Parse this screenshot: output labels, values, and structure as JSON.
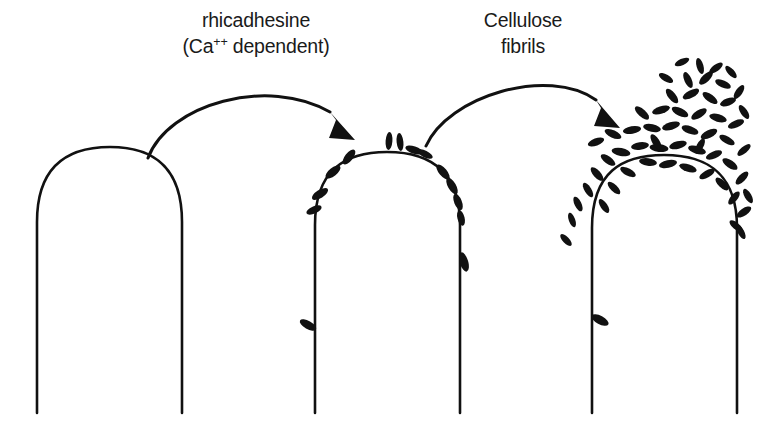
{
  "figure": {
    "background_color": "#ffffff",
    "ink_color": "#111111",
    "width": 777,
    "height": 428
  },
  "labels": [
    {
      "name": "rhicadhesine-label",
      "line1": "rhicadhesine",
      "line2_prefix": "(Ca",
      "line2_sup": "++",
      "line2_suffix": " dependent)",
      "x": 256,
      "y1": 27,
      "y2": 53
    },
    {
      "name": "cellulose-fibrils-label",
      "line1": "Cellulose",
      "line2": "fibrils",
      "x": 523,
      "y1": 27,
      "y2": 53
    }
  ],
  "arrows": [
    {
      "name": "arrow-stage-1-to-2",
      "path": "M 148 158 C 168 104 268 76 330 112",
      "head": "M 330 112 L 355 140 L 329 138 L 336 120 Z"
    },
    {
      "name": "arrow-stage-2-to-3",
      "path": "M 426 146 C 448 96 548 66 596 100",
      "head": "M 596 100 L 620 128 L 594 126 L 601 108 Z"
    }
  ],
  "cells": [
    {
      "name": "root-tip-stage-1-bare",
      "outline": "M 37 413 L 37 222 C 37 166 68 147 110 147 C 152 147 182 166 182 222 L 182 413",
      "left_stem_x": 37,
      "right_stem_x": 182,
      "apex_y": 147,
      "base_y": 413,
      "bacteria": []
    },
    {
      "name": "root-tip-stage-2-sparse-attachment",
      "outline": "M 315 413 L 315 225 C 315 170 345 152 387 152 C 429 152 460 170 460 225 L 460 413",
      "left_stem_x": 315,
      "right_stem_x": 460,
      "apex_y": 152,
      "base_y": 413,
      "bacteria": [
        {
          "cx": 389,
          "cy": 141,
          "rx": 3.4,
          "ry": 9.0,
          "rot": 4
        },
        {
          "cx": 400,
          "cy": 142,
          "rx": 3.4,
          "ry": 9.0,
          "rot": -6
        },
        {
          "cx": 414,
          "cy": 150,
          "rx": 9.0,
          "ry": 3.6,
          "rot": 18
        },
        {
          "cx": 425,
          "cy": 154,
          "rx": 8.4,
          "ry": 3.4,
          "rot": 26
        },
        {
          "cx": 349,
          "cy": 157,
          "rx": 4.0,
          "ry": 9.0,
          "rot": 38
        },
        {
          "cx": 333,
          "cy": 172,
          "rx": 4.0,
          "ry": 9.0,
          "rot": 52
        },
        {
          "cx": 443,
          "cy": 172,
          "rx": 4.0,
          "ry": 9.2,
          "rot": -40
        },
        {
          "cx": 452,
          "cy": 186,
          "rx": 4.0,
          "ry": 9.2,
          "rot": -30
        },
        {
          "cx": 458,
          "cy": 202,
          "rx": 3.8,
          "ry": 8.6,
          "rot": -22
        },
        {
          "cx": 461,
          "cy": 218,
          "rx": 3.6,
          "ry": 8.0,
          "rot": -14
        },
        {
          "cx": 320,
          "cy": 194,
          "rx": 4.0,
          "ry": 9.2,
          "rot": 58
        },
        {
          "cx": 314,
          "cy": 210,
          "rx": 3.6,
          "ry": 8.2,
          "rot": 66
        },
        {
          "cx": 464,
          "cy": 262,
          "rx": 4.2,
          "ry": 10.0,
          "rot": -16
        },
        {
          "cx": 308,
          "cy": 325,
          "rx": 9.2,
          "ry": 4.0,
          "rot": 30
        }
      ]
    },
    {
      "name": "root-tip-stage-3-dense-biofilm",
      "outline": "M 592 413 L 592 228 C 592 172 622 155 664 155 C 706 155 737 172 737 228 L 737 413",
      "left_stem_x": 592,
      "right_stem_x": 737,
      "apex_y": 155,
      "base_y": 413,
      "bacteria": [
        {
          "cx": 621,
          "cy": 152,
          "rx": 9.5,
          "ry": 4.0,
          "rot": 10
        },
        {
          "cx": 640,
          "cy": 146,
          "rx": 9.0,
          "ry": 3.8,
          "rot": -8
        },
        {
          "cx": 659,
          "cy": 148,
          "rx": 9.5,
          "ry": 4.0,
          "rot": 6
        },
        {
          "cx": 678,
          "cy": 145,
          "rx": 9.0,
          "ry": 3.8,
          "rot": -14
        },
        {
          "cx": 697,
          "cy": 150,
          "rx": 9.2,
          "ry": 3.8,
          "rot": 16
        },
        {
          "cx": 714,
          "cy": 155,
          "rx": 8.6,
          "ry": 3.6,
          "rot": -22
        },
        {
          "cx": 730,
          "cy": 164,
          "rx": 8.8,
          "ry": 3.8,
          "rot": 34
        },
        {
          "cx": 742,
          "cy": 178,
          "rx": 8.4,
          "ry": 3.6,
          "rot": -46
        },
        {
          "cx": 748,
          "cy": 196,
          "rx": 8.0,
          "ry": 3.4,
          "rot": 60
        },
        {
          "cx": 744,
          "cy": 212,
          "rx": 8.4,
          "ry": 3.6,
          "rot": -34
        },
        {
          "cx": 736,
          "cy": 226,
          "rx": 8.0,
          "ry": 3.4,
          "rot": 40
        },
        {
          "cx": 608,
          "cy": 160,
          "rx": 8.6,
          "ry": 3.6,
          "rot": 36
        },
        {
          "cx": 597,
          "cy": 174,
          "rx": 8.6,
          "ry": 3.6,
          "rot": 48
        },
        {
          "cx": 588,
          "cy": 190,
          "rx": 8.2,
          "ry": 3.4,
          "rot": 58
        },
        {
          "cx": 578,
          "cy": 204,
          "rx": 8.0,
          "ry": 3.4,
          "rot": 64
        },
        {
          "cx": 572,
          "cy": 220,
          "rx": 7.6,
          "ry": 3.2,
          "rot": 70
        },
        {
          "cx": 596,
          "cy": 142,
          "rx": 8.6,
          "ry": 3.6,
          "rot": -20
        },
        {
          "cx": 613,
          "cy": 134,
          "rx": 9.0,
          "ry": 3.8,
          "rot": 24
        },
        {
          "cx": 632,
          "cy": 130,
          "rx": 9.2,
          "ry": 3.8,
          "rot": -10
        },
        {
          "cx": 652,
          "cy": 128,
          "rx": 9.0,
          "ry": 3.8,
          "rot": 12
        },
        {
          "cx": 671,
          "cy": 126,
          "rx": 9.2,
          "ry": 3.8,
          "rot": -16
        },
        {
          "cx": 690,
          "cy": 130,
          "rx": 8.8,
          "ry": 3.8,
          "rot": 20
        },
        {
          "cx": 709,
          "cy": 134,
          "rx": 9.0,
          "ry": 3.8,
          "rot": -26
        },
        {
          "cx": 727,
          "cy": 140,
          "rx": 8.6,
          "ry": 3.6,
          "rot": 30
        },
        {
          "cx": 744,
          "cy": 150,
          "rx": 8.2,
          "ry": 3.4,
          "rot": -40
        },
        {
          "cx": 642,
          "cy": 113,
          "rx": 9.0,
          "ry": 3.8,
          "rot": 42
        },
        {
          "cx": 661,
          "cy": 110,
          "rx": 9.2,
          "ry": 3.8,
          "rot": -18
        },
        {
          "cx": 680,
          "cy": 112,
          "rx": 9.0,
          "ry": 3.8,
          "rot": 26
        },
        {
          "cx": 699,
          "cy": 114,
          "rx": 8.8,
          "ry": 3.8,
          "rot": -32
        },
        {
          "cx": 718,
          "cy": 118,
          "rx": 9.0,
          "ry": 3.8,
          "rot": 16
        },
        {
          "cx": 736,
          "cy": 124,
          "rx": 8.6,
          "ry": 3.6,
          "rot": -22
        },
        {
          "cx": 672,
          "cy": 96,
          "rx": 8.8,
          "ry": 3.8,
          "rot": 52
        },
        {
          "cx": 691,
          "cy": 94,
          "rx": 9.0,
          "ry": 3.8,
          "rot": -28
        },
        {
          "cx": 710,
          "cy": 98,
          "rx": 8.8,
          "ry": 3.8,
          "rot": 36
        },
        {
          "cx": 728,
          "cy": 102,
          "rx": 8.4,
          "ry": 3.6,
          "rot": -20
        },
        {
          "cx": 744,
          "cy": 112,
          "rx": 8.0,
          "ry": 3.4,
          "rot": 56
        },
        {
          "cx": 688,
          "cy": 80,
          "rx": 8.6,
          "ry": 3.6,
          "rot": 66
        },
        {
          "cx": 706,
          "cy": 78,
          "rx": 8.8,
          "ry": 3.8,
          "rot": -44
        },
        {
          "cx": 723,
          "cy": 84,
          "rx": 8.4,
          "ry": 3.6,
          "rot": 24
        },
        {
          "cx": 739,
          "cy": 92,
          "rx": 8.0,
          "ry": 3.4,
          "rot": -56
        },
        {
          "cx": 700,
          "cy": 66,
          "rx": 8.2,
          "ry": 3.4,
          "rot": 74
        },
        {
          "cx": 716,
          "cy": 68,
          "rx": 8.0,
          "ry": 3.4,
          "rot": -36
        },
        {
          "cx": 731,
          "cy": 72,
          "rx": 7.8,
          "ry": 3.2,
          "rot": 48
        },
        {
          "cx": 648,
          "cy": 162,
          "rx": 9.0,
          "ry": 3.8,
          "rot": 8
        },
        {
          "cx": 668,
          "cy": 164,
          "rx": 9.2,
          "ry": 3.8,
          "rot": -12
        },
        {
          "cx": 688,
          "cy": 168,
          "rx": 9.0,
          "ry": 3.8,
          "rot": 18
        },
        {
          "cx": 707,
          "cy": 174,
          "rx": 8.6,
          "ry": 3.6,
          "rot": -30
        },
        {
          "cx": 722,
          "cy": 184,
          "rx": 8.4,
          "ry": 3.6,
          "rot": 44
        },
        {
          "cx": 734,
          "cy": 198,
          "rx": 8.0,
          "ry": 3.4,
          "rot": -50
        },
        {
          "cx": 741,
          "cy": 232,
          "rx": 7.8,
          "ry": 3.2,
          "rot": 62
        },
        {
          "cx": 628,
          "cy": 172,
          "rx": 8.6,
          "ry": 3.6,
          "rot": 28
        },
        {
          "cx": 614,
          "cy": 188,
          "rx": 8.2,
          "ry": 3.4,
          "rot": 44
        },
        {
          "cx": 604,
          "cy": 206,
          "rx": 8.0,
          "ry": 3.4,
          "rot": 56
        },
        {
          "cx": 566,
          "cy": 240,
          "rx": 7.6,
          "ry": 3.2,
          "rot": 46
        },
        {
          "cx": 600,
          "cy": 320,
          "rx": 9.4,
          "ry": 4.2,
          "rot": 28
        },
        {
          "cx": 656,
          "cy": 142,
          "rx": 8.8,
          "ry": 3.6,
          "rot": 58
        },
        {
          "cx": 700,
          "cy": 146,
          "rx": 8.4,
          "ry": 3.4,
          "rot": -62
        },
        {
          "cx": 666,
          "cy": 78,
          "rx": 8.0,
          "ry": 3.4,
          "rot": 30
        },
        {
          "cx": 682,
          "cy": 62,
          "rx": 7.8,
          "ry": 3.2,
          "rot": -24
        }
      ]
    }
  ]
}
